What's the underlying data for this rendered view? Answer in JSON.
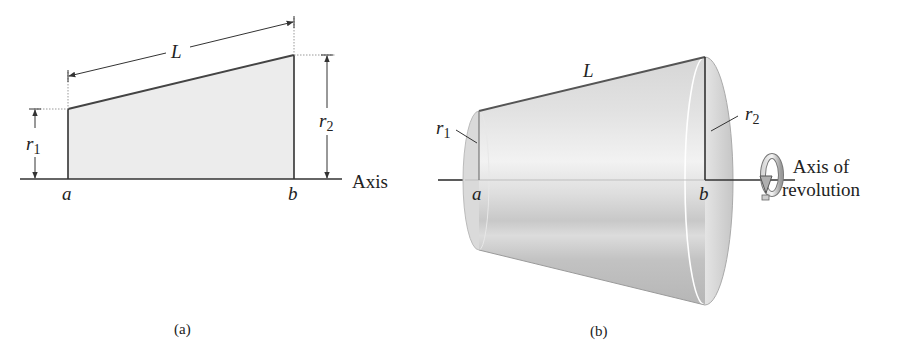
{
  "panel_a": {
    "caption": "(a)",
    "labels": {
      "length": "L",
      "r1": "r",
      "r1_sub": "1",
      "r2": "r",
      "r2_sub": "2",
      "a": "a",
      "b": "b",
      "axis": "Axis"
    },
    "fill_color": "#ececec",
    "edge_color": "#444444"
  },
  "panel_b": {
    "caption": "(b)",
    "labels": {
      "length": "L",
      "r1": "r",
      "r1_sub": "1",
      "r2": "r",
      "r2_sub": "2",
      "a": "a",
      "b": "b",
      "axis_line1": "Axis of",
      "axis_line2": "revolution"
    },
    "icon": "rotation-arrow-icon",
    "surface_color": "#cfcfcf"
  }
}
